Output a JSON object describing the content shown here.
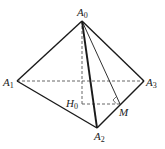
{
  "diagram": {
    "colors": {
      "edge": "#1a1a1a",
      "hidden": "#555555",
      "background": "#ffffff"
    },
    "points": {
      "A0": {
        "x": 82,
        "y": 21
      },
      "A1": {
        "x": 17,
        "y": 81
      },
      "A2": {
        "x": 97,
        "y": 128
      },
      "A3": {
        "x": 144,
        "y": 81
      },
      "H0": {
        "x": 82,
        "y": 104
      },
      "M": {
        "x": 120,
        "y": 104
      }
    },
    "labels": {
      "A0": {
        "base": "A",
        "sub": "0"
      },
      "A1": {
        "base": "A",
        "sub": "1"
      },
      "A2": {
        "base": "A",
        "sub": "2"
      },
      "A3": {
        "base": "A",
        "sub": "3"
      },
      "H0": {
        "base": "H",
        "sub": "0"
      },
      "M": {
        "base": "M",
        "sub": ""
      }
    },
    "solid_edges": [
      "A0-A1",
      "A0-A3",
      "A0-A2",
      "A1-A2",
      "A2-A3",
      "A0-M"
    ],
    "dashed_edges": [
      "A1-A3",
      "A0-H0",
      "H0-M"
    ],
    "right_angle_marks": [
      "M"
    ]
  }
}
